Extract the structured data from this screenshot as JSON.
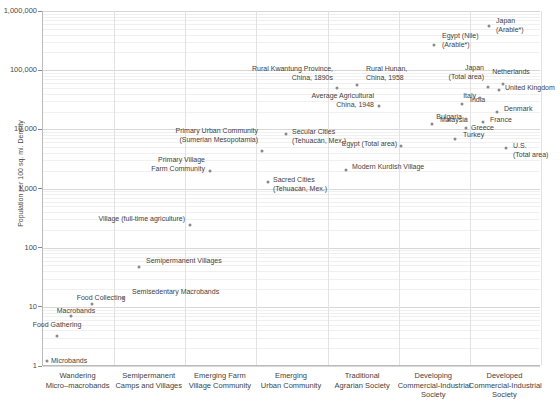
{
  "chart_data": {
    "type": "scatter",
    "title": "",
    "xlabel": "",
    "ylabel": "Population per 100 sq. mi. Density",
    "yscale": "log",
    "ylim": [
      1,
      1000000
    ],
    "ytick_labels": [
      "1,000,000",
      "100,000",
      "10,000",
      "1,000",
      "100",
      "10",
      "1"
    ],
    "ytick_values": [
      1000000,
      100000,
      10000,
      1000,
      100,
      10,
      1
    ],
    "grid": true,
    "legend": "none",
    "categories": [
      "Wandering\nMicro–macrobands",
      "Semipermanent\nCamps and Villages",
      "Emerging Farm\nVillage Community",
      "Emerging\nUrban Community",
      "Traditional\nAgrarian Society",
      "Developing\nCommercial-Industrial\nSociety",
      "Developed\nCommercial-Industrial\nSociety"
    ],
    "points": [
      {
        "label": "Microbands",
        "x": 47,
        "y": 361,
        "lx": 51,
        "ly": 357,
        "align": "l",
        "value": 1.1,
        "category": "Wandering Micro–macrobands"
      },
      {
        "label": "Food Gathering",
        "x": 57,
        "y": 336,
        "lx": 57,
        "ly": 321,
        "align": "c",
        "value": 3.5,
        "category": "Wandering Micro–macrobands"
      },
      {
        "label": "Macrobands",
        "x": 71,
        "y": 316,
        "lx": 76,
        "ly": 307,
        "align": "c",
        "value": 7,
        "category": "Wandering Micro–macrobands"
      },
      {
        "label": "Food Collecting",
        "x": 92,
        "y": 304,
        "lx": 101,
        "ly": 294,
        "align": "c",
        "value": 11,
        "category": "Wandering Micro–macrobands"
      },
      {
        "label": "Semisedentary Macrobands",
        "x": 123,
        "y": 298,
        "lx": 132,
        "ly": 288,
        "align": "l",
        "value": 14,
        "category": "Semipermanent Camps and Villages"
      },
      {
        "label": "Semipermanent Villages",
        "x": 139,
        "y": 267,
        "lx": 146,
        "ly": 257,
        "align": "l",
        "value": 60,
        "category": "Semipermanent Camps and Villages"
      },
      {
        "label": "Village (full-time agriculture)",
        "x": 190,
        "y": 225,
        "lx": 185,
        "ly": 215,
        "align": "r",
        "value": 250,
        "category": "Emerging Farm Village Community"
      },
      {
        "label": "Primary Village\nFarm Community",
        "x": 210,
        "y": 171,
        "lx": 205,
        "ly": 156,
        "align": "r",
        "value": 2100,
        "category": "Emerging Farm Village Community"
      },
      {
        "label": "Sacred Cities\n(Tehuacán, Mex.)",
        "x": 268,
        "y": 182,
        "lx": 273,
        "ly": 176,
        "align": "l",
        "value": 1500,
        "category": "Emerging Urban Community"
      },
      {
        "label": "Primary Urban Community\n(Sumerian Mesopotamia)",
        "x": 262,
        "y": 151,
        "lx": 258,
        "ly": 127,
        "align": "r",
        "value": 4700,
        "category": "Emerging Urban Community"
      },
      {
        "label": "Secular Cities\n(Tehuacán, Mex.)",
        "x": 286,
        "y": 134,
        "lx": 292,
        "ly": 128,
        "align": "l",
        "value": 7200,
        "category": "Emerging Urban Community"
      },
      {
        "label": "Modern Kurdish Village",
        "x": 346,
        "y": 170,
        "lx": 352,
        "ly": 163,
        "align": "l",
        "value": 2400,
        "category": "Traditional Agrarian Society"
      },
      {
        "label": "Rural Kwantung Province,\nChina, 1890s",
        "x": 337,
        "y": 88,
        "lx": 333,
        "ly": 65,
        "align": "r",
        "value": 46000,
        "category": "Traditional Agrarian Society"
      },
      {
        "label": "Rural Hunan,\nChina, 1958",
        "x": 357,
        "y": 85,
        "lx": 366,
        "ly": 65,
        "align": "l",
        "value": 52000,
        "category": "Traditional Agrarian Society"
      },
      {
        "label": "Average Agricultural\nChina, 1948",
        "x": 379,
        "y": 106,
        "lx": 374,
        "ly": 92,
        "align": "r",
        "value": 21000,
        "category": "Traditional Agrarian Society"
      },
      {
        "label": "Egypt (Total area)",
        "x": 401,
        "y": 146,
        "lx": 397,
        "ly": 140,
        "align": "r",
        "value": 5800,
        "category": "Traditional Agrarian Society"
      },
      {
        "label": "Egypt (Nile)\n(Arable*)",
        "x": 434,
        "y": 45,
        "lx": 442,
        "ly": 32,
        "align": "l",
        "value": 290000,
        "category": "Developing Commercial-Industrial Society"
      },
      {
        "label": "India",
        "x": 462,
        "y": 104,
        "lx": 470,
        "ly": 96,
        "align": "l",
        "value": 23000,
        "category": "Developing Commercial-Industrial Society"
      },
      {
        "label": "Malaysia",
        "x": 432,
        "y": 124,
        "lx": 440,
        "ly": 116,
        "align": "l",
        "value": 11500,
        "category": "Developing Commercial-Industrial Society"
      },
      {
        "label": "Turkey",
        "x": 455,
        "y": 139,
        "lx": 463,
        "ly": 131,
        "align": "l",
        "value": 7000,
        "category": "Developing Commercial-Industrial Society"
      },
      {
        "label": "Bulgaria",
        "x": 466,
        "y": 119,
        "lx": 462,
        "ly": 113,
        "align": "r",
        "value": 13500,
        "category": "Developing Commercial-Industrial Society"
      },
      {
        "label": "Greece",
        "x": 466,
        "y": 128,
        "lx": 471,
        "ly": 124,
        "align": "l",
        "value": 9500,
        "category": "Developing Commercial-Industrial Society"
      },
      {
        "label": "Japan\n(Arable*)",
        "x": 489,
        "y": 26,
        "lx": 496,
        "ly": 17,
        "align": "l",
        "value": 560000,
        "category": "Developed Commercial-Industrial Society"
      },
      {
        "label": "Japan\n(Total area)",
        "x": 488,
        "y": 87,
        "lx": 484,
        "ly": 64,
        "align": "r",
        "value": 42000,
        "category": "Developed Commercial-Industrial Society"
      },
      {
        "label": "Netherlands",
        "x": 503,
        "y": 84,
        "lx": 511,
        "ly": 68,
        "align": "c",
        "value": 46000,
        "category": "Developed Commercial-Industrial Society"
      },
      {
        "label": "United Kingdom",
        "x": 499,
        "y": 90,
        "lx": 505,
        "ly": 84,
        "align": "l",
        "value": 40000,
        "category": "Developed Commercial-Industrial Society"
      },
      {
        "label": "Italy",
        "x": 480,
        "y": 98,
        "lx": 476,
        "ly": 92,
        "align": "r",
        "value": 29000,
        "category": "Developed Commercial-Industrial Society"
      },
      {
        "label": "Denmark",
        "x": 497,
        "y": 112,
        "lx": 504,
        "ly": 105,
        "align": "l",
        "value": 15000,
        "category": "Developed Commercial-Industrial Society"
      },
      {
        "label": "France",
        "x": 483,
        "y": 122,
        "lx": 490,
        "ly": 116,
        "align": "l",
        "value": 11000,
        "category": "Developed Commercial-Industrial Society"
      },
      {
        "label": "U.S.\n(Total area)",
        "x": 506,
        "y": 148,
        "lx": 513,
        "ly": 142,
        "align": "l",
        "value": 5400,
        "category": "Developed Commercial-Industrial Society"
      }
    ],
    "footnote": "* Arable land only"
  },
  "axis": {
    "y_title": "Population per 100 sq. mi. Density"
  }
}
